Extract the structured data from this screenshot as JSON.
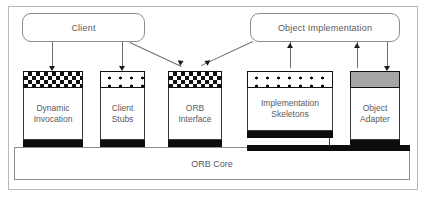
{
  "diagram": {
    "title": "ORB Core",
    "actors": [
      {
        "id": "client",
        "label": "Client"
      },
      {
        "id": "object-implementation",
        "label": "Object Implementation"
      }
    ],
    "components": [
      {
        "id": "dynamic-invocation",
        "label_line1": "Dynamic",
        "label_line2": "Invocation",
        "cap_style": "checkered"
      },
      {
        "id": "client-stubs",
        "label_line1": "Client",
        "label_line2": "Stubs",
        "cap_style": "dotted"
      },
      {
        "id": "orb-interface",
        "label_line1": "ORB",
        "label_line2": "Interface",
        "cap_style": "checkered"
      },
      {
        "id": "implementation-skeletons",
        "label_line1": "Implementation",
        "label_line2": "Skeletons",
        "cap_style": "dotted"
      },
      {
        "id": "object-adapter",
        "label_line1": "Object",
        "label_line2": "Adapter",
        "cap_style": "solid-gray"
      }
    ],
    "core": {
      "id": "orb-core",
      "label": "ORB Core"
    },
    "colors": {
      "cap_fill_black": "#111111",
      "cap_fill_gray": "#a6a6a6",
      "foot_black": "#0d0d0d",
      "text": "#5a5a5a",
      "border": "#8d8d8d",
      "connector": "#6f6f6f"
    }
  }
}
